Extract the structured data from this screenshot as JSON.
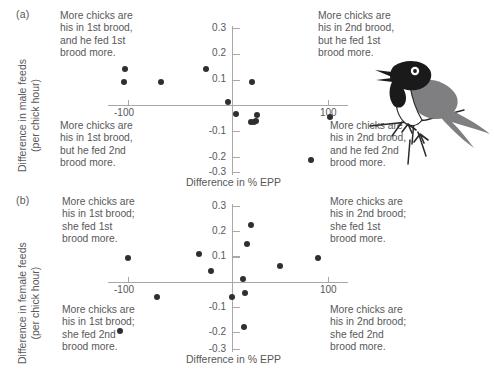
{
  "figure": {
    "background": "#ffffff",
    "text_color": "#58585a",
    "dot_color": "#2f2f33",
    "axis_color": "#a8a8aa"
  },
  "panels": [
    {
      "letter": "(a)",
      "ylabel_line1": "Difference in male feeds",
      "ylabel_line2": "(per chick hour)",
      "xlabel": "Difference in % EPP",
      "quadrant_notes": {
        "top_left": "More chicks are\nhis in 1st brood,\nand he fed 1st\nbrood more.",
        "top_right": "More chicks are\nhis in 2nd brood,\nbut he fed 1st\nbrood more.",
        "bottom_left": "More chicks are\nhis in 1st brood,\nbut he fed 2nd\nbrood more.",
        "bottom_right": "More chicks are\nhis in 2nd brood,\nand he fed 2nd\nbrood more."
      }
    },
    {
      "letter": "(b)",
      "ylabel_line1": "Difference in female feeds",
      "ylabel_line2": "(per chick hour)",
      "xlabel": "Difference in % EPP",
      "quadrant_notes": {
        "top_left": "More chicks are\nhis in 1st brood;\nshe fed 1st\nbrood more.",
        "top_right": "More chicks are\nhis in 2nd brood;\nshe fed 1st\nbrood more.",
        "bottom_left": "More chicks are\nhis in 1st brood;\nshe fed 2nd\nbrood more.",
        "bottom_right": "More chicks are\nhis in 2nd brood;\nshe fed 2nd\nbrood more."
      }
    }
  ],
  "chart_data": [
    {
      "type": "scatter",
      "panel": "(a)",
      "title": "Difference in male feeds vs difference in % EPP",
      "xlabel": "Difference in % EPP",
      "ylabel": "Difference in male feeds (per chick hour)",
      "xlim": [
        -140,
        140
      ],
      "ylim": [
        -0.34,
        0.34
      ],
      "xticks": [
        -100,
        100
      ],
      "xtick_labels": [
        "-100",
        "100"
      ],
      "yticks": [
        -0.3,
        -0.2,
        -0.1,
        0.1,
        0.2,
        0.3
      ],
      "ytick_labels": [
        "-0.3",
        "-0.2",
        "-0.1",
        "0.1",
        "0.2",
        "0.3"
      ],
      "grid": false,
      "legend": null,
      "points": [
        {
          "x": -108,
          "y": 0.145
        },
        {
          "x": -109,
          "y": 0.093
        },
        {
          "x": -72,
          "y": 0.092
        },
        {
          "x": -27,
          "y": 0.143
        },
        {
          "x": 19,
          "y": 0.094
        },
        {
          "x": -5,
          "y": 0.012
        },
        {
          "x": 3,
          "y": -0.033
        },
        {
          "x": 24,
          "y": -0.037
        },
        {
          "x": 18,
          "y": -0.064
        },
        {
          "x": 21,
          "y": -0.066
        },
        {
          "x": 23,
          "y": -0.062
        },
        {
          "x": 97,
          "y": -0.047
        },
        {
          "x": 78,
          "y": -0.215
        }
      ]
    },
    {
      "type": "scatter",
      "panel": "(b)",
      "title": "Difference in female feeds vs difference in % EPP",
      "xlabel": "Difference in % EPP",
      "ylabel": "Difference in female feeds (per chick hour)",
      "xlim": [
        -140,
        140
      ],
      "ylim": [
        -0.34,
        0.34
      ],
      "xticks": [
        -100,
        100
      ],
      "xtick_labels": [
        "-100",
        "100"
      ],
      "yticks": [
        -0.3,
        -0.2,
        -0.1,
        0.1,
        0.2,
        0.3
      ],
      "ytick_labels": [
        "-0.3",
        "-0.2",
        "-0.1",
        "0.1",
        "0.2",
        "0.3"
      ],
      "grid": false,
      "legend": null,
      "points": [
        {
          "x": -105,
          "y": 0.095
        },
        {
          "x": -113,
          "y": -0.19
        },
        {
          "x": -76,
          "y": -0.055
        },
        {
          "x": -34,
          "y": 0.11
        },
        {
          "x": -22,
          "y": 0.047
        },
        {
          "x": 18,
          "y": 0.225
        },
        {
          "x": 14,
          "y": 0.15
        },
        {
          "x": 10,
          "y": 0.015
        },
        {
          "x": 12,
          "y": -0.042
        },
        {
          "x": 11,
          "y": -0.175
        },
        {
          "x": -1,
          "y": -0.055
        },
        {
          "x": 47,
          "y": 0.063
        },
        {
          "x": 85,
          "y": 0.097
        }
      ]
    }
  ],
  "illustration": {
    "name": "barn-swallow-perched-on-branch",
    "colors": {
      "body_dark": "#1a1a1a",
      "wing_gray": "#7f7f82",
      "breast_white": "#ffffff",
      "outline": "#2a2a2a"
    }
  }
}
